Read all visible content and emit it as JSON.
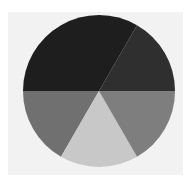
{
  "chart_data": {
    "type": "pie",
    "title": "",
    "legend": null,
    "labels_shown": false,
    "center": [
      99,
      91
    ],
    "radius": 76,
    "start_angle_deg": 0,
    "direction": "counterclockwise",
    "slices": [
      {
        "name": "slice-1",
        "value": 16.7,
        "start_deg": 0,
        "end_deg": 60,
        "color": "#2f2f2f",
        "position": "upper-right"
      },
      {
        "name": "slice-2",
        "value": 33.3,
        "start_deg": 60,
        "end_deg": 180,
        "color": "#1e1e1e",
        "position": "top"
      },
      {
        "name": "slice-3",
        "value": 16.7,
        "start_deg": 180,
        "end_deg": 240,
        "color": "#707070",
        "position": "lower-left"
      },
      {
        "name": "slice-4",
        "value": 16.7,
        "start_deg": 240,
        "end_deg": 300,
        "color": "#c8c8c8",
        "position": "bottom"
      },
      {
        "name": "slice-5",
        "value": 16.7,
        "start_deg": 300,
        "end_deg": 360,
        "color": "#7e7e7e",
        "position": "lower-right"
      }
    ],
    "values": [
      16.7,
      33.3,
      16.7,
      16.7,
      16.7
    ],
    "categories": [
      "slice-1",
      "slice-2",
      "slice-3",
      "slice-4",
      "slice-5"
    ]
  },
  "colors": {
    "page_background": "#ffffff",
    "plot_background": "#f2f2f2"
  }
}
